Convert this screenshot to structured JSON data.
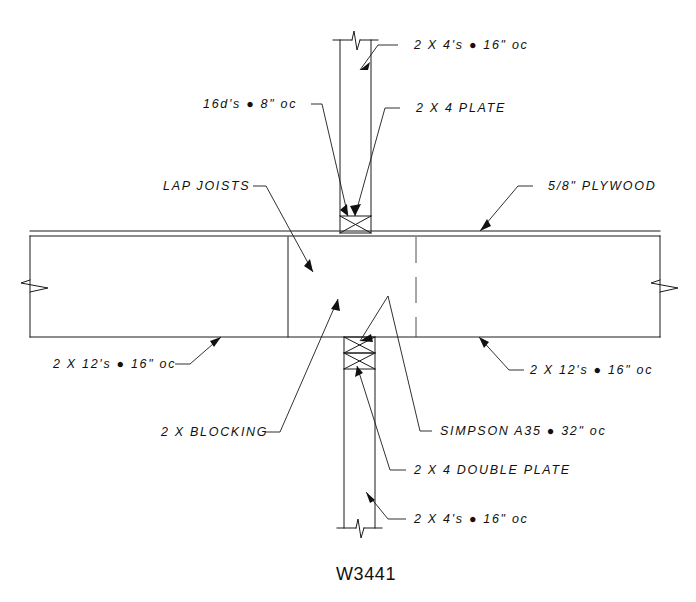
{
  "drawing": {
    "title": "W3441",
    "sheet_width": 696,
    "sheet_height": 602,
    "line_color": "#1a1a1a",
    "background_color": "#ffffff"
  },
  "annotations": {
    "top_stud": "2 X 4's ● 16\" oc",
    "top_plate": "2 X 4 PLATE",
    "nailing": "16d's ● 8\" oc",
    "lap_joists": "LAP JOISTS",
    "plywood": "5/8\" PLYWOOD",
    "joists_left": "2 X 12's ● 16\" oc",
    "joists_right": "2 X 12's ● 16\" oc",
    "blocking": "2 X BLOCKING",
    "simpson": "SIMPSON A35 ● 32\" oc",
    "double_plate": "2 X 4 DOUBLE PLATE",
    "bottom_stud": "2 X 4's ● 16\" oc"
  },
  "components": {
    "top_wall_label": "upper-wall-studs",
    "top_plate_label": "top-plate-block",
    "floor_label": "floor-joist-assembly",
    "plywood_label": "plywood-sheathing",
    "double_plate_label": "double-plate-block",
    "bottom_wall_label": "lower-wall-studs",
    "break_symbol_label": "break-symbol"
  }
}
